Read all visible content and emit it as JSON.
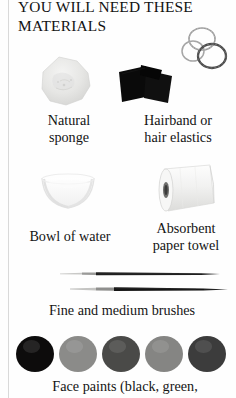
{
  "page": {
    "title": "YOU WILL NEED THESE MATERIALS",
    "background_color": "#fefefe",
    "rule_color": "#d9d9d9"
  },
  "items": [
    {
      "caption": "Natural\nsponge",
      "caption_line1": "Natural",
      "caption_line2": "sponge",
      "image_name": "natural-sponge-photo",
      "color": "#e4e4e2"
    },
    {
      "caption": "Hairband or\nhair elastics",
      "caption_line1": "Hairband or",
      "caption_line2": "hair elastics",
      "image_name": "hairbands-photo",
      "color": "#0b0b0b",
      "elastics_color": "#8e8e8e"
    },
    {
      "caption": "Bowl of water",
      "caption_line1": "Bowl of water",
      "image_name": "bowl-of-water-photo",
      "color": "#f2f2f2"
    },
    {
      "caption": "Absorbent\npaper towel",
      "caption_line1": "Absorbent",
      "caption_line2": "paper towel",
      "image_name": "paper-towel-roll-photo",
      "color": "#f6f6f6"
    },
    {
      "caption": "Fine and medium brushes",
      "caption_line1": "Fine and medium brushes",
      "image_name": "paint-brushes-photo",
      "color": "#1a1a1a"
    },
    {
      "caption": "Face paints (black, green,",
      "caption_line1": "Face paints (black, green,",
      "image_name": "face-paint-dots-photo"
    }
  ],
  "paint_dots": [
    {
      "name": "paint-dot-black",
      "color": "#0d0c0c"
    },
    {
      "name": "paint-dot-green",
      "color": "#8b8b89"
    },
    {
      "name": "paint-dot-dark",
      "color": "#4a4a48"
    },
    {
      "name": "paint-dot-gray",
      "color": "#858583"
    },
    {
      "name": "paint-dot-deep",
      "color": "#3c3c3c"
    }
  ]
}
